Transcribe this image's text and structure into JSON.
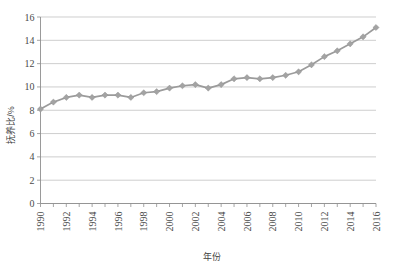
{
  "chart_data": {
    "type": "line",
    "title": "",
    "xlabel": "年份",
    "ylabel": "抚养比/%",
    "xlim": [
      1990,
      2016
    ],
    "ylim": [
      0,
      16
    ],
    "yticks": [
      0,
      2,
      4,
      6,
      8,
      10,
      12,
      14,
      16
    ],
    "xticks": [
      1990,
      1992,
      1994,
      1996,
      1998,
      2000,
      2002,
      2004,
      2006,
      2008,
      2010,
      2012,
      2014,
      2016
    ],
    "x": [
      1990,
      1991,
      1992,
      1993,
      1994,
      1995,
      1996,
      1997,
      1998,
      1999,
      2000,
      2001,
      2002,
      2003,
      2004,
      2005,
      2006,
      2007,
      2008,
      2009,
      2010,
      2011,
      2012,
      2013,
      2014,
      2015,
      2016
    ],
    "values": [
      8.1,
      8.7,
      9.1,
      9.3,
      9.1,
      9.3,
      9.3,
      9.1,
      9.5,
      9.6,
      9.9,
      10.1,
      10.2,
      9.9,
      10.2,
      10.7,
      10.8,
      10.7,
      10.8,
      11.0,
      11.3,
      11.9,
      12.6,
      13.1,
      13.7,
      14.3,
      15.1
    ],
    "series": [
      {
        "name": "抚养比",
        "color": "#a3a3a3",
        "marker": "diamond",
        "values": [
          8.1,
          8.7,
          9.1,
          9.3,
          9.1,
          9.3,
          9.3,
          9.1,
          9.5,
          9.6,
          9.9,
          10.1,
          10.2,
          9.9,
          10.2,
          10.7,
          10.8,
          10.7,
          10.8,
          11.0,
          11.3,
          11.9,
          12.6,
          13.1,
          13.7,
          14.3,
          15.1
        ]
      }
    ],
    "grid": true,
    "grid_axis": "y",
    "legend": false,
    "legend_position": "none",
    "colors": {
      "line": "#9b9b9b",
      "marker": "#a3a3a3",
      "grid": "#b9b9b9",
      "axis": "#8f8f8f",
      "text": "#4a4a4a",
      "background": "#ffffff"
    }
  }
}
